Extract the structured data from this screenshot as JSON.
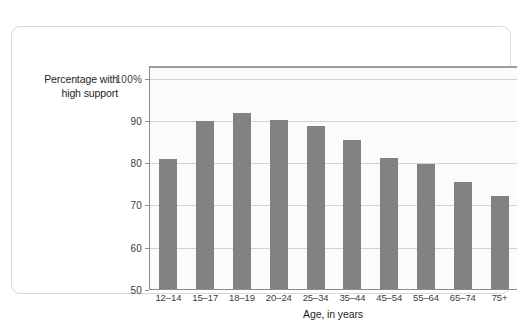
{
  "chart_data": {
    "type": "bar",
    "title": "",
    "subtitle": "",
    "ylabel_line1": "Percentage with",
    "ylabel_line2": "high support",
    "xlabel": "Age, in years",
    "categories": [
      "12–14",
      "15–17",
      "18–19",
      "20–24",
      "25–34",
      "35–44",
      "45–54",
      "55–64",
      "65–74",
      "75+"
    ],
    "values": [
      81.0,
      90.0,
      92.0,
      90.2,
      88.7,
      85.4,
      81.3,
      79.7,
      75.5,
      72.3
    ],
    "ylim": [
      50,
      103
    ],
    "yticks": [
      100,
      90,
      80,
      70,
      60,
      50
    ],
    "ytick_labels": [
      "100%",
      "90",
      "80",
      "70",
      "60",
      "50"
    ],
    "grid": true,
    "legend": "none",
    "series_color": "#828282",
    "gridline_color": "#d2d2d2",
    "axis_color": "#8d8d8d",
    "plot_background": "#fbfbfb",
    "card_background": "#ffffff",
    "card_border_color": "#d9d9d9"
  }
}
